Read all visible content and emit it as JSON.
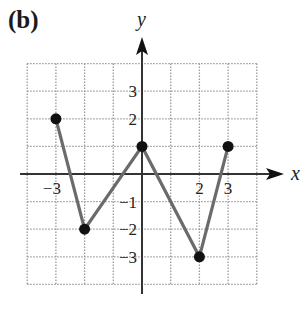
{
  "panel_label": "(b)",
  "colors": {
    "line": "#6b6b6b",
    "point": "#111111",
    "axis": "#333333",
    "grid": "#9a9a9a"
  },
  "chart_data": {
    "type": "line",
    "title": "(b)",
    "xlabel": "x",
    "ylabel": "y",
    "xlim": [
      -4,
      4
    ],
    "ylim": [
      -4,
      4
    ],
    "grid": true,
    "x_tick_labels": [
      "-3",
      "2",
      "3"
    ],
    "y_tick_labels": [
      "3",
      "2",
      "-1",
      "-2",
      "-3"
    ],
    "series": [
      {
        "name": "piecewise-linear",
        "x": [
          -3,
          -2,
          0,
          2,
          3
        ],
        "y": [
          2,
          -2,
          1,
          -3,
          1
        ]
      }
    ]
  }
}
